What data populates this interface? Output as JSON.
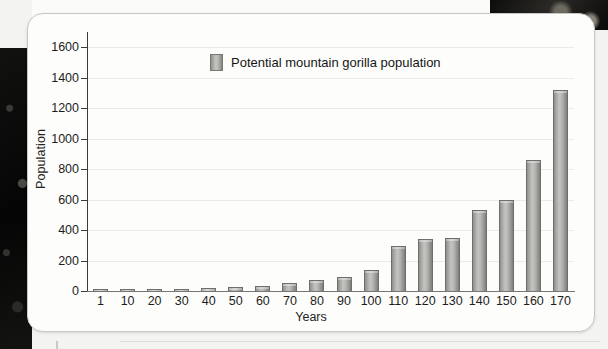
{
  "chart_data": {
    "type": "bar",
    "title": "",
    "xlabel": "Years",
    "ylabel": "Population",
    "categories": [
      "1",
      "10",
      "20",
      "30",
      "40",
      "50",
      "60",
      "70",
      "80",
      "90",
      "100",
      "110",
      "120",
      "130",
      "140",
      "150",
      "160",
      "170"
    ],
    "values": [
      5,
      6,
      8,
      10,
      18,
      25,
      35,
      50,
      70,
      90,
      135,
      295,
      343,
      350,
      530,
      597,
      860,
      1320
    ],
    "series": [
      {
        "name": "Potential mountain gorilla population",
        "values": [
          5,
          6,
          8,
          10,
          18,
          25,
          35,
          50,
          70,
          90,
          135,
          295,
          343,
          350,
          530,
          597,
          860,
          1320
        ]
      }
    ],
    "ylim": [
      0,
      1700
    ],
    "xlim_categorical": true,
    "y_ticks": [
      0,
      200,
      400,
      600,
      800,
      1000,
      1200,
      1400,
      1600
    ],
    "y_tick_labels": [
      "0",
      "200",
      "400",
      "600",
      "800",
      "1000",
      "1200",
      "1400",
      "1600"
    ],
    "grid": "horizontal",
    "legend_position": "top-center",
    "legend_entries": [
      "Potential mountain gorilla population"
    ],
    "bar_color": "#b4b4b0",
    "bar_edge_color": "#6e6e6a",
    "axis_color": "#3b3b3b",
    "grid_color": "#eceae6",
    "background_color": "#fdfdfc"
  },
  "legend": {
    "label": "Potential mountain gorilla population",
    "swatch_color": "#b4b4b0"
  },
  "axes": {
    "x_title": "Years",
    "y_title": "Population"
  },
  "card": {
    "background_color": "#fdfdfc",
    "border_color": "#c7c7c4"
  }
}
